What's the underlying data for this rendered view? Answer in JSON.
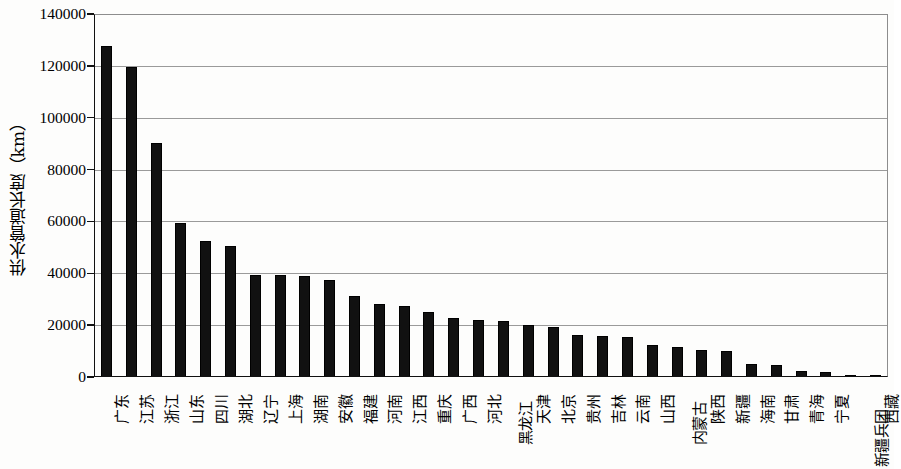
{
  "chart_data": {
    "type": "bar",
    "title": "",
    "xlabel": "",
    "ylabel": "供水管道长度（km）",
    "ylim": [
      0,
      140000
    ],
    "ytick_values": [
      0,
      20000,
      40000,
      60000,
      80000,
      100000,
      120000,
      140000
    ],
    "ytick_labels": [
      "0",
      "20000",
      "40000",
      "60000",
      "80000",
      "100000",
      "120000",
      "140000"
    ],
    "grid": true,
    "legend": "none",
    "bar_color": "#111111",
    "categories": [
      "广东",
      "江苏",
      "浙江",
      "山东",
      "四川",
      "湖北",
      "辽宁",
      "上海",
      "湖南",
      "安徽",
      "福建",
      "河南",
      "江西",
      "重庆",
      "广西",
      "河北",
      "黑龙江",
      "天津",
      "北京",
      "贵州",
      "吉林",
      "云南",
      "山西",
      "内蒙古",
      "陕西",
      "新疆",
      "海南",
      "甘肃",
      "青海",
      "宁夏",
      "新疆兵团",
      "西藏"
    ],
    "values": [
      127800,
      119500,
      90200,
      59300,
      52300,
      50400,
      39200,
      39400,
      39100,
      37400,
      31100,
      28200,
      27300,
      25200,
      22900,
      21800,
      21600,
      20200,
      19200,
      16200,
      16000,
      15400,
      12200,
      11500,
      10500,
      9900,
      5200,
      4600,
      2200,
      1900,
      900,
      700
    ]
  }
}
